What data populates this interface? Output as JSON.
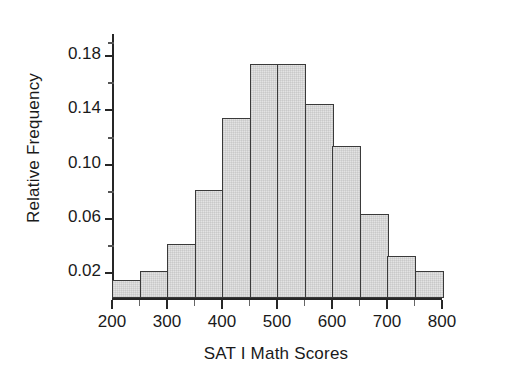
{
  "chart_data": {
    "type": "bar",
    "title": "",
    "xlabel": "SAT I Math Scores",
    "ylabel": "Relative Frequency",
    "xlim": [
      200,
      800
    ],
    "ylim": [
      0,
      0.195
    ],
    "grid": false,
    "legend": null,
    "bin_width": 50,
    "bin_edges": [
      200,
      250,
      300,
      350,
      400,
      450,
      500,
      550,
      600,
      650,
      700,
      750,
      800
    ],
    "categories": [
      "200-250",
      "250-300",
      "300-350",
      "350-400",
      "400-450",
      "450-500",
      "500-550",
      "550-600",
      "600-650",
      "650-700",
      "700-750",
      "750-800"
    ],
    "values": [
      0.013,
      0.02,
      0.04,
      0.08,
      0.133,
      0.173,
      0.173,
      0.143,
      0.112,
      0.062,
      0.031,
      0.02
    ],
    "xticks": [
      {
        "value": 200,
        "label": "200"
      },
      {
        "value": 300,
        "label": "300"
      },
      {
        "value": 400,
        "label": "400"
      },
      {
        "value": 500,
        "label": "500"
      },
      {
        "value": 600,
        "label": "600"
      },
      {
        "value": 700,
        "label": "700"
      },
      {
        "value": 800,
        "label": "800"
      }
    ],
    "xticks_minor": [
      250,
      350,
      450,
      550,
      650,
      750
    ],
    "yticks": [
      {
        "value": 0.02,
        "label": "0.02"
      },
      {
        "value": 0.06,
        "label": "0.06"
      },
      {
        "value": 0.1,
        "label": "0.10"
      },
      {
        "value": 0.14,
        "label": "0.14"
      },
      {
        "value": 0.18,
        "label": "0.18"
      }
    ],
    "yticks_minor": [
      0.04,
      0.08,
      0.12,
      0.16,
      0.19
    ],
    "colors": {
      "bar_fill": "#e3e3e3",
      "bar_edge": "#3a3a3a",
      "axis": "#262626",
      "text": "#1a1a1a",
      "background": "#ffffff"
    }
  }
}
